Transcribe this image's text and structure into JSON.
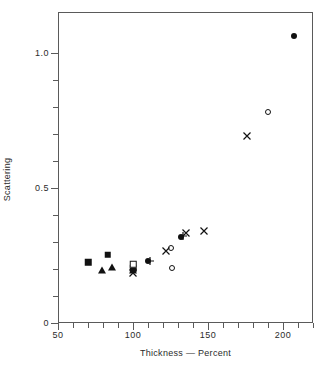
{
  "chart_data": {
    "type": "scatter",
    "title": "",
    "xlabel": "Thickness — Percent",
    "ylabel": "Scattering",
    "xlim": [
      50,
      220
    ],
    "ylim": [
      0,
      1.15
    ],
    "grid": false,
    "legend": "none",
    "xticks": [
      50,
      100,
      150,
      200
    ],
    "xtick_labels": [
      "50",
      "100",
      "150",
      "200"
    ],
    "xminor_step": 10,
    "yticks": [
      0,
      0.5,
      1.0
    ],
    "ytick_labels": [
      "0",
      "0.5",
      "1.0"
    ],
    "yminor_step": 0.1,
    "series": [
      {
        "name": "filled-square",
        "marker": "filled-square",
        "points": [
          {
            "x": 70,
            "y": 0.225
          },
          {
            "x": 83,
            "y": 0.252
          },
          {
            "x": 100,
            "y": 0.203
          }
        ]
      },
      {
        "name": "filled-triangle",
        "marker": "filled-triangle",
        "points": [
          {
            "x": 79,
            "y": 0.196
          },
          {
            "x": 86,
            "y": 0.208
          },
          {
            "x": 100,
            "y": 0.196
          }
        ]
      },
      {
        "name": "open-square",
        "marker": "open-square",
        "points": [
          {
            "x": 100,
            "y": 0.218
          }
        ]
      },
      {
        "name": "filled-circle",
        "marker": "filled-circle",
        "points": [
          {
            "x": 110,
            "y": 0.228
          },
          {
            "x": 132,
            "y": 0.318
          },
          {
            "x": 207,
            "y": 1.06
          }
        ]
      },
      {
        "name": "open-circle",
        "marker": "open-circle",
        "points": [
          {
            "x": 125,
            "y": 0.277
          },
          {
            "x": 126,
            "y": 0.202
          },
          {
            "x": 190,
            "y": 0.78
          }
        ]
      },
      {
        "name": "cross",
        "marker": "cross",
        "points": [
          {
            "x": 100,
            "y": 0.186
          },
          {
            "x": 122,
            "y": 0.266
          },
          {
            "x": 135,
            "y": 0.334
          },
          {
            "x": 147,
            "y": 0.341
          },
          {
            "x": 176,
            "y": 0.69
          }
        ]
      },
      {
        "name": "plus",
        "marker": "plus",
        "points": [
          {
            "x": 111,
            "y": 0.228
          },
          {
            "x": 133,
            "y": 0.322
          }
        ]
      }
    ]
  }
}
